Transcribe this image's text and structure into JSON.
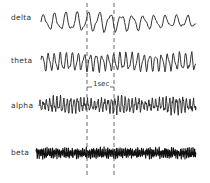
{
  "figure": {
    "traces": [
      {
        "name": "delta",
        "label": "delta",
        "label_x": 11,
        "label_y": 13,
        "baseline": 22,
        "amp": 11,
        "cycles": 14,
        "noise": 0.1,
        "x0": 41,
        "x1": 196,
        "stroke": 1.0,
        "color": "#333333"
      },
      {
        "name": "theta",
        "label": "theta",
        "label_x": 11,
        "label_y": 56,
        "baseline": 62,
        "amp": 10,
        "cycles": 26,
        "noise": 0.15,
        "x0": 41,
        "x1": 196,
        "stroke": 1.0,
        "color": "#333333"
      },
      {
        "name": "alpha",
        "label": "alpha",
        "label_x": 11,
        "label_y": 101,
        "baseline": 105,
        "amp": 9,
        "cycles": 46,
        "noise": 0.35,
        "x0": 39,
        "x1": 196,
        "stroke": 0.9,
        "color": "#222222"
      },
      {
        "name": "beta",
        "label": "beta",
        "label_x": 11,
        "label_y": 151,
        "baseline": 153,
        "amp": 4,
        "cycles": 90,
        "noise": 0.8,
        "x0": 36,
        "x1": 196,
        "stroke": 1.1,
        "color": "#111111"
      }
    ],
    "time_marker": {
      "label": "1sec",
      "x_start": 87,
      "x_end": 114,
      "y_top": 3,
      "y_bottom": 178,
      "label_y": 82
    }
  }
}
